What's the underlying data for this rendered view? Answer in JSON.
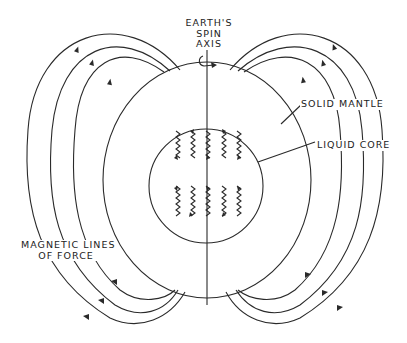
{
  "diagram": {
    "labels": {
      "spin_axis_line1": "EARTH'S",
      "spin_axis_line2": "SPIN",
      "spin_axis_line3": "AXIS",
      "solid_mantle": "SOLID MANTLE",
      "liquid_core": "LIQUID CORE",
      "magnetic_lines_line1": "MAGNETIC LINES",
      "magnetic_lines_line2": "OF FORCE"
    },
    "components": {
      "outer_sphere": "solid mantle",
      "inner_sphere": "liquid core",
      "axis": "spin axis",
      "field_lines_left": 3,
      "field_lines_right": 3,
      "core_convection_squiggles": 10
    },
    "colors": {
      "line": "#2a2a2a",
      "background": "#ffffff"
    }
  }
}
